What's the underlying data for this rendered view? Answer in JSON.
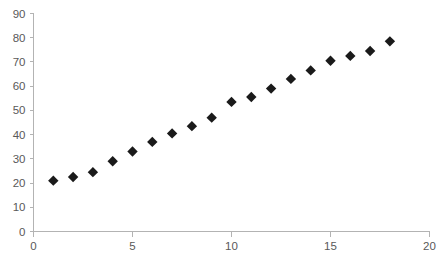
{
  "chart_data": {
    "type": "scatter",
    "title": "",
    "subtitle": "",
    "xlabel": "",
    "ylabel": "",
    "x": [
      1,
      2,
      3,
      4,
      5,
      6,
      7,
      8,
      9,
      10,
      11,
      12,
      13,
      14,
      15,
      16,
      17,
      18
    ],
    "values": [
      21,
      22.5,
      24.5,
      29,
      33,
      37,
      40.5,
      43.5,
      47,
      53.5,
      55.5,
      59,
      63,
      66.5,
      70.5,
      72.5,
      74.5,
      78.5
    ],
    "series": [
      {
        "name": "series-1",
        "marker": "diamond",
        "color": "#1a1a1a",
        "points": [
          {
            "x": 1,
            "y": 21
          },
          {
            "x": 2,
            "y": 22.5
          },
          {
            "x": 3,
            "y": 24.5
          },
          {
            "x": 4,
            "y": 29
          },
          {
            "x": 5,
            "y": 33
          },
          {
            "x": 6,
            "y": 37
          },
          {
            "x": 7,
            "y": 40.5
          },
          {
            "x": 8,
            "y": 43.5
          },
          {
            "x": 9,
            "y": 47
          },
          {
            "x": 10,
            "y": 53.5
          },
          {
            "x": 11,
            "y": 55.5
          },
          {
            "x": 12,
            "y": 59
          },
          {
            "x": 13,
            "y": 63
          },
          {
            "x": 14,
            "y": 66.5
          },
          {
            "x": 15,
            "y": 70.5
          },
          {
            "x": 16,
            "y": 72.5
          },
          {
            "x": 17,
            "y": 74.5
          },
          {
            "x": 18,
            "y": 78.5
          }
        ]
      }
    ],
    "xlim": [
      0,
      20
    ],
    "ylim": [
      0,
      90
    ],
    "x_ticks": [
      0,
      5,
      10,
      15,
      20
    ],
    "x_tick_labels": [
      "0",
      "5",
      "10",
      "15",
      "20"
    ],
    "x_minor_ticks": [
      1,
      2,
      3,
      4,
      6,
      7,
      8,
      9,
      11,
      12,
      13,
      14,
      16,
      17,
      18,
      19
    ],
    "y_ticks": [
      0,
      10,
      20,
      30,
      40,
      50,
      60,
      70,
      80,
      90
    ],
    "y_tick_labels": [
      "0",
      "10",
      "20",
      "30",
      "40",
      "50",
      "60",
      "70",
      "80",
      "90"
    ],
    "grid": false,
    "legend": false,
    "legend_position": "none",
    "axis_color": "#b3b3b3",
    "tick_label_color": "#595959",
    "marker_color": "#1a1a1a",
    "background_color": "#ffffff"
  }
}
